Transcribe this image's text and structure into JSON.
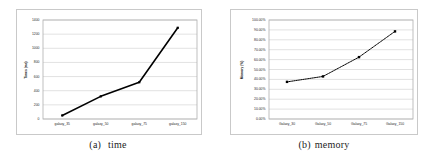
{
  "figure": {
    "panels": [
      {
        "id": "a",
        "caption_tag": "(a)",
        "caption_text": "time",
        "chart_name": "time-chart"
      },
      {
        "id": "b",
        "caption_tag": "(b)",
        "caption_text": "memory",
        "chart_name": "memory-chart"
      }
    ],
    "colors": {
      "series_line": "#000000",
      "marker": "#000000",
      "gridline": "#d4d4d4",
      "frame_border": "#c9c9c9",
      "axis_line": "#b0b0b0",
      "text": "#2b2b2b",
      "background": "#ffffff"
    }
  },
  "chart_data": [
    {
      "type": "line",
      "title": "",
      "xlabel": "",
      "ylabel": "Times (ms)",
      "categories": [
        "galaxy_35",
        "galaxy_50",
        "galaxy_75",
        "galaxy_150"
      ],
      "values": [
        50,
        320,
        520,
        1290
      ],
      "ylim": [
        0,
        1400
      ],
      "ytick_labels": [
        "0",
        "200",
        "400",
        "600",
        "800",
        "1000",
        "1200",
        "1400"
      ],
      "ytick_values": [
        0,
        200,
        400,
        600,
        800,
        1000,
        1200,
        1400
      ],
      "grid": "horizontal",
      "legend": "none",
      "marker": "square",
      "linestyle": "solid"
    },
    {
      "type": "line",
      "title": "",
      "xlabel": "",
      "ylabel": "Memory (%)",
      "categories": [
        "Galaxy_30",
        "Galaxy_50",
        "Galaxy_75",
        "Galaxy_150"
      ],
      "values": [
        37.5,
        43.0,
        62.5,
        88.5
      ],
      "ylim": [
        0,
        100
      ],
      "ytick_labels": [
        "0.00%",
        "10.00%",
        "20.00%",
        "30.00%",
        "40.00%",
        "50.00%",
        "60.00%",
        "70.00%",
        "80.00%",
        "90.00%",
        "100.00%"
      ],
      "ytick_values": [
        0,
        10,
        20,
        30,
        40,
        50,
        60,
        70,
        80,
        90,
        100
      ],
      "grid": "horizontal",
      "legend": "none",
      "marker": "square",
      "linestyle": "dotted"
    }
  ]
}
